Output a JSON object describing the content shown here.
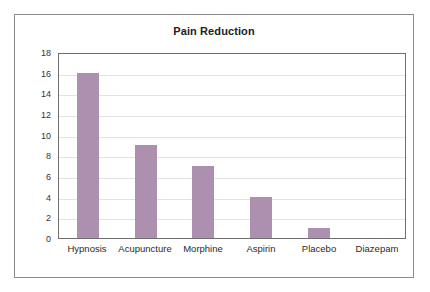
{
  "chart_data": {
    "type": "bar",
    "title": "Pain Reduction",
    "categories": [
      "Hypnosis",
      "Acupuncture",
      "Morphine",
      "Aspirin",
      "Placebo",
      "Diazepam"
    ],
    "values": [
      16,
      9,
      7,
      4,
      1,
      0
    ],
    "xlabel": "",
    "ylabel": "",
    "ylim": [
      0,
      18
    ],
    "ytick_step": 2,
    "yticks": [
      18,
      16,
      14,
      12,
      10,
      8,
      6,
      4,
      2,
      0
    ],
    "grid": true,
    "legend": false,
    "bar_color": "#ad8fb0",
    "gridline_color": "#e2e2e6",
    "axis_color": "#6e6e6e",
    "frame_color": "#8a8a8a",
    "background": "#ffffff"
  }
}
